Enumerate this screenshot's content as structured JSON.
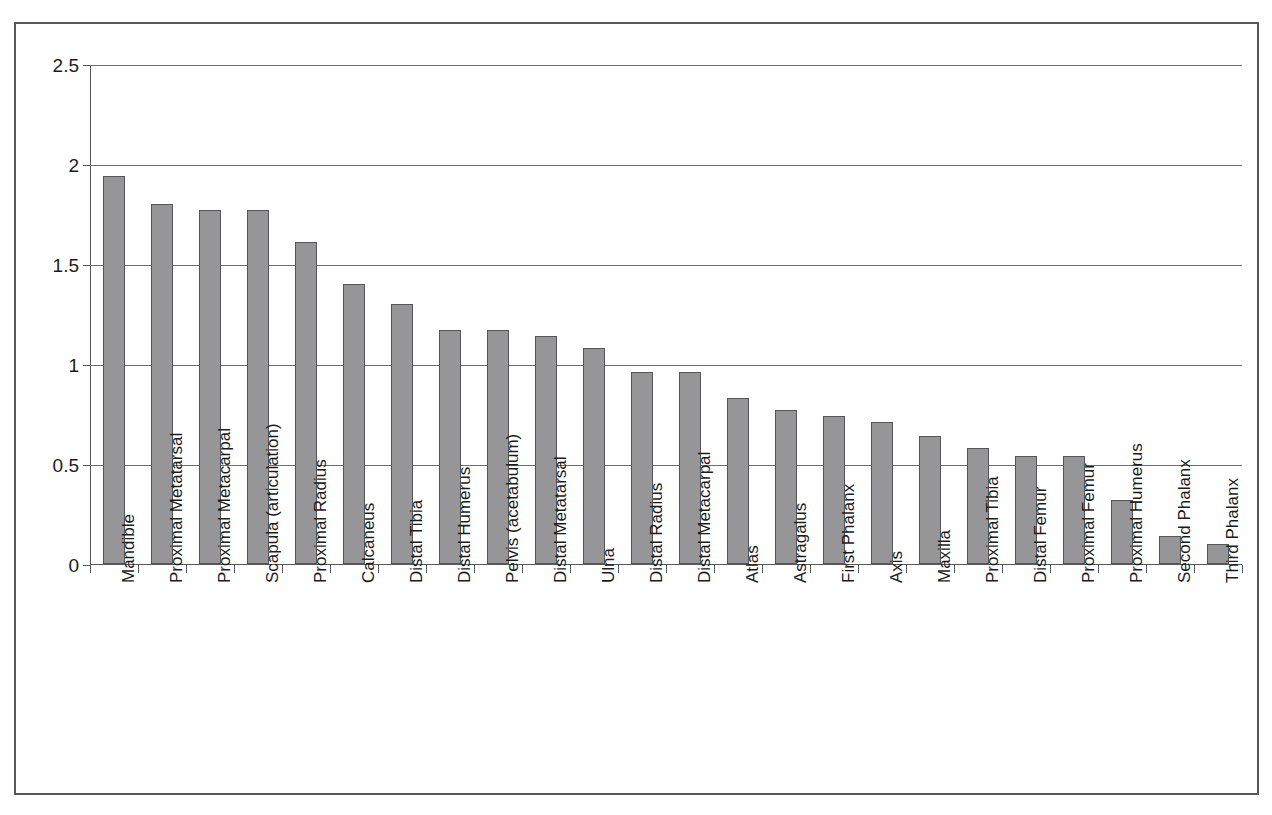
{
  "chart_data": {
    "type": "bar",
    "title": "",
    "subtitle": "",
    "xlabel": "",
    "ylabel": "",
    "ylim": [
      0,
      2.5
    ],
    "ytick_labels": [
      "0",
      "0.5",
      "1",
      "1.5",
      "2",
      "2.5"
    ],
    "ytick_values": [
      0,
      0.5,
      1,
      1.5,
      2,
      2.5
    ],
    "grid": "horizontal",
    "legend": "none",
    "bar_color": "#969698",
    "bar_edge_color": "#565658",
    "axis_color": "#58585a",
    "gridline_color": "#6e6e70",
    "categories": [
      "Mandible",
      "Proximal Metatarsal",
      "Proximal Metacarpal",
      "Scapula (articulation)",
      "Proximal Radius",
      "Calcaneus",
      "Distal Tibia",
      "Distal Humerus",
      "Pelvis (acetabulum)",
      "Distal Metatarsal",
      "Ulna",
      "Distal Radius",
      "Distal Metacarpal",
      "Atlas",
      "Astragalus",
      "First Phalanx",
      "Axis",
      "Maxilla",
      "Proximal Tibia",
      "Distal Femur",
      "Proximal Femur",
      "Proximal Humerus",
      "Second Phalanx",
      "Third Phalanx"
    ],
    "values": [
      1.94,
      1.8,
      1.77,
      1.77,
      1.61,
      1.4,
      1.3,
      1.17,
      1.17,
      1.14,
      1.08,
      0.96,
      0.96,
      0.83,
      0.77,
      0.74,
      0.71,
      0.64,
      0.58,
      0.54,
      0.54,
      0.32,
      0.14,
      0.1
    ]
  }
}
